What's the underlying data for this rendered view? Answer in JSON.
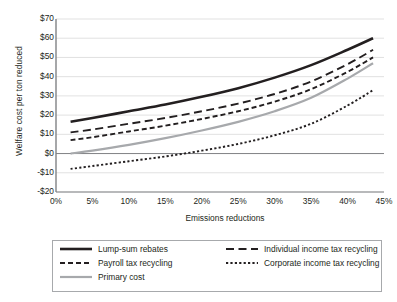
{
  "chart_data": {
    "type": "line",
    "title": "",
    "xlabel": "Emissions reductions",
    "ylabel": "Welfare cost per ton reduced",
    "xlim": [
      0,
      45
    ],
    "ylim": [
      -20,
      70
    ],
    "xtick_labels": [
      "0%",
      "5%",
      "10%",
      "15%",
      "20%",
      "25%",
      "30%",
      "35%",
      "40%",
      "45%"
    ],
    "xtick_values": [
      0,
      5,
      10,
      15,
      20,
      25,
      30,
      35,
      40,
      45
    ],
    "ytick_labels": [
      "$70",
      "$60",
      "$50",
      "$40",
      "$30",
      "$20",
      "$10",
      "$0",
      "-$10",
      "-$20"
    ],
    "ytick_values": [
      70,
      60,
      50,
      40,
      30,
      20,
      10,
      0,
      -10,
      -20
    ],
    "grid": "horizontal",
    "legend_position": "bottom",
    "x": [
      2,
      5,
      10,
      15,
      20,
      25,
      30,
      35,
      40,
      43.5
    ],
    "series": [
      {
        "name": "Lump-sum rebates",
        "style": "solid-thick",
        "color": "#231f20",
        "values": [
          16.5,
          18.5,
          22.0,
          25.5,
          29.5,
          34.0,
          39.5,
          46.0,
          54.0,
          60.0
        ]
      },
      {
        "name": "Individual income tax recycling",
        "style": "long-dash",
        "color": "#231f20",
        "values": [
          11.0,
          12.5,
          15.5,
          18.5,
          22.0,
          26.0,
          31.0,
          37.5,
          46.5,
          54.0
        ]
      },
      {
        "name": "Payroll tax recycling",
        "style": "medium-dash",
        "color": "#231f20",
        "values": [
          7.0,
          8.5,
          11.5,
          14.5,
          18.0,
          22.0,
          27.0,
          33.5,
          42.5,
          50.0
        ]
      },
      {
        "name": "Corporate income tax recycling",
        "style": "dotted",
        "color": "#231f20",
        "values": [
          -8.0,
          -6.5,
          -4.0,
          -1.5,
          1.5,
          5.0,
          9.5,
          15.5,
          25.0,
          33.0
        ]
      },
      {
        "name": "Primary cost",
        "style": "solid-gray",
        "color": "#a7a9ac",
        "values": [
          0.0,
          1.5,
          4.5,
          8.0,
          12.0,
          16.5,
          22.0,
          29.0,
          39.0,
          47.0
        ]
      }
    ],
    "legend": [
      {
        "label": "Lump-sum rebates",
        "style": "solid-thick",
        "color": "#231f20"
      },
      {
        "label": "Individual income tax recycling",
        "style": "long-dash",
        "color": "#231f20"
      },
      {
        "label": "Payroll tax recycling",
        "style": "medium-dash",
        "color": "#231f20"
      },
      {
        "label": "Corporate income tax recycling",
        "style": "dotted",
        "color": "#231f20"
      },
      {
        "label": "Primary cost",
        "style": "solid-gray",
        "color": "#a7a9ac"
      }
    ],
    "colors": {
      "axis": "#808285",
      "grid": "#d9d9d9",
      "zero_line": "#808285",
      "text": "#231f20",
      "primary_cost": "#a7a9ac",
      "line": "#231f20",
      "legend_border": "#a7a9ac",
      "background": "#ffffff"
    }
  }
}
